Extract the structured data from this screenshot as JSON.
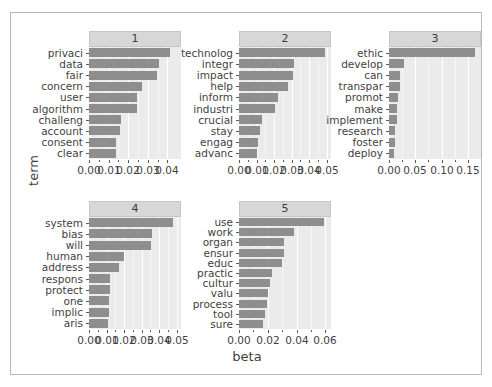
{
  "chart_data": {
    "type": "bar",
    "title": "",
    "xlabel": "beta",
    "ylabel": "term",
    "orientation": "horizontal",
    "facet_layout": "wrap",
    "grid": true,
    "legend": "none",
    "bar_color": "#8e8e8e",
    "panel_background": "#ebebeb",
    "strip_background": "#d7d7d7",
    "panels": [
      {
        "label": "1",
        "xlim": [
          0,
          0.047
        ],
        "xticks": [
          0.0,
          0.01,
          0.02,
          0.03,
          0.04
        ],
        "xticklabels": [
          "0.00",
          "0.01",
          "0.02",
          "0.03",
          "0.04"
        ],
        "categories": [
          "privaci",
          "data",
          "fair",
          "concern",
          "user",
          "algorithm",
          "challeng",
          "account",
          "consent",
          "clear"
        ],
        "values": [
          0.0415,
          0.0358,
          0.0347,
          0.0272,
          0.0245,
          0.0243,
          0.0162,
          0.0159,
          0.014,
          0.0137
        ]
      },
      {
        "label": "2",
        "xlim": [
          0,
          0.0525
        ],
        "xticks": [
          0.0,
          0.01,
          0.02,
          0.03,
          0.04,
          0.05
        ],
        "xticklabels": [
          "0.00",
          "0.01",
          "0.02",
          "0.03",
          "0.04",
          "0.05"
        ],
        "categories": [
          "technolog",
          "integr",
          "impact",
          "help",
          "inform",
          "industri",
          "crucial",
          "stay",
          "engag",
          "advanc"
        ],
        "values": [
          0.0493,
          0.0313,
          0.031,
          0.0281,
          0.0225,
          0.0205,
          0.0132,
          0.0117,
          0.0108,
          0.0103
        ]
      },
      {
        "label": "3",
        "xlim": [
          0,
          0.175
        ],
        "xticks": [
          0.0,
          0.05,
          0.1,
          0.15
        ],
        "xticklabels": [
          "0.00",
          "0.05",
          "0.10",
          "0.15"
        ],
        "categories": [
          "ethic",
          "develop",
          "can",
          "transpar",
          "promot",
          "make",
          "implement",
          "research",
          "foster",
          "deploy"
        ],
        "values": [
          0.164,
          0.0285,
          0.0215,
          0.0205,
          0.0165,
          0.015,
          0.015,
          0.011,
          0.0105,
          0.01
        ]
      },
      {
        "label": "4",
        "xlim": [
          0,
          0.0525
        ],
        "xticks": [
          0.0,
          0.01,
          0.02,
          0.03,
          0.04,
          0.05
        ],
        "xticklabels": [
          "0.00",
          "0.01",
          "0.02",
          "0.03",
          "0.04",
          "0.05"
        ],
        "categories": [
          "system",
          "bias",
          "will",
          "human",
          "address",
          "respons",
          "protect",
          "one",
          "implic",
          "aris"
        ],
        "values": [
          0.048,
          0.036,
          0.0352,
          0.0198,
          0.0172,
          0.012,
          0.0118,
          0.0115,
          0.0112,
          0.011
        ]
      },
      {
        "label": "5",
        "xlim": [
          0,
          0.064
        ],
        "xticks": [
          0.0,
          0.02,
          0.04,
          0.06
        ],
        "xticklabels": [
          "0.00",
          "0.02",
          "0.04",
          "0.06"
        ],
        "categories": [
          "use",
          "work",
          "organ",
          "ensur",
          "educ",
          "practic",
          "cultur",
          "valu",
          "process",
          "tool",
          "sure"
        ],
        "values": [
          0.059,
          0.038,
          0.0315,
          0.0312,
          0.03,
          0.0228,
          0.0215,
          0.0202,
          0.0198,
          0.0178,
          0.017
        ]
      }
    ]
  }
}
